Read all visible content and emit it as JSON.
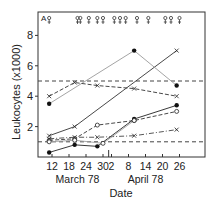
{
  "chart_data": {
    "type": "line",
    "panel_label": "A",
    "title": "",
    "xlabel": "Date",
    "ylabel": "Leukocytes (x1000)",
    "ylim": [
      0,
      9.5
    ],
    "yticks": [
      2,
      4,
      6,
      8
    ],
    "xticks": [
      {
        "day": 12,
        "label": "12"
      },
      {
        "day": 18,
        "label": "18"
      },
      {
        "day": 24,
        "label": "24"
      },
      {
        "day": 30,
        "label": "30"
      },
      {
        "day": 33,
        "label": "2"
      },
      {
        "day": 39,
        "label": "8"
      },
      {
        "day": 45,
        "label": "14"
      },
      {
        "day": 51,
        "label": "20"
      },
      {
        "day": 57,
        "label": "26"
      }
    ],
    "month_labels": [
      {
        "label": "March 78",
        "day": 21
      },
      {
        "label": "April 78",
        "day": 45
      }
    ],
    "month_divider_day": 32,
    "x_domain_days": [
      7,
      61
    ],
    "reference_lines": [
      {
        "name": "upper-normal-limit",
        "value": 5.0,
        "style": "dashed"
      },
      {
        "name": "lower-normal-limit",
        "value": 1.0,
        "style": "dashed"
      }
    ],
    "event_markers_days": [
      11,
      21,
      22,
      25,
      28,
      30,
      34,
      36,
      38,
      42,
      46,
      52,
      54,
      57
    ],
    "series": [
      {
        "name": "series-1",
        "line": "solid",
        "color": "#333333",
        "marker": "x",
        "points": [
          [
            11,
            1.4
          ],
          [
            20,
            2.0
          ],
          [
            56,
            7.0
          ]
        ]
      },
      {
        "name": "series-2",
        "line": "solid",
        "color": "#9a9a9a",
        "marker": "dot",
        "points": [
          [
            11,
            3.5
          ],
          [
            41,
            7.0
          ],
          [
            56,
            4.7
          ]
        ]
      },
      {
        "name": "series-3",
        "line": "dashed",
        "color": "#333333",
        "marker": "x",
        "points": [
          [
            11,
            4.0
          ],
          [
            20,
            4.9
          ],
          [
            28,
            4.7
          ],
          [
            41,
            4.5
          ],
          [
            56,
            4.0
          ]
        ]
      },
      {
        "name": "series-4",
        "line": "solid",
        "color": "#222222",
        "marker": "dot",
        "points": [
          [
            11,
            0.3
          ],
          [
            20,
            0.8
          ],
          [
            28,
            0.7
          ],
          [
            41,
            2.5
          ],
          [
            56,
            3.4
          ]
        ]
      },
      {
        "name": "series-5",
        "line": "dashed",
        "color": "#333333",
        "marker": "circle",
        "points": [
          [
            11,
            1.1
          ],
          [
            20,
            1.2
          ],
          [
            28,
            2.1
          ],
          [
            41,
            2.4
          ],
          [
            56,
            3.0
          ]
        ]
      },
      {
        "name": "series-6",
        "line": "dashdot",
        "color": "#444444",
        "marker": "x",
        "points": [
          [
            11,
            1.2
          ],
          [
            20,
            1.3
          ],
          [
            28,
            1.3
          ],
          [
            41,
            1.4
          ],
          [
            56,
            1.8
          ]
        ]
      },
      {
        "name": "series-7",
        "line": "solid",
        "color": "#a0a0a0",
        "marker": "circle",
        "points": [
          [
            11,
            1.0
          ],
          [
            20,
            1.1
          ],
          [
            30,
            0.9
          ],
          [
            41,
            2.4
          ]
        ]
      }
    ],
    "grid": false,
    "legend": "none"
  }
}
